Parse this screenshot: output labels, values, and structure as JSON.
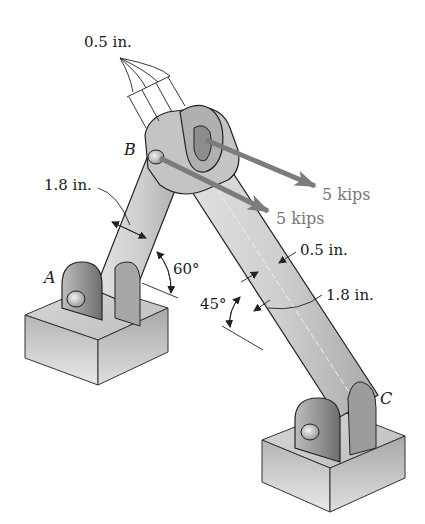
{
  "figure": {
    "type": "engineering-statics-frame",
    "colors": {
      "member_fill": "#c8c8c8",
      "member_dark": "#9a9a9a",
      "member_light": "#e0e0e0",
      "support_fill": "#cfcfcf",
      "support_dark": "#a5a5a5",
      "load_arrow": "#808080",
      "outline": "#222222",
      "text": "#1a1a1a",
      "load_text": "#777777"
    }
  },
  "points": {
    "A": "A",
    "B": "B",
    "C": "C"
  },
  "dimensions": {
    "pin_thickness_top": "0.5 in.",
    "member_ab_width": "1.8 in.",
    "member_bc_thickness": "0.5 in.",
    "member_bc_width": "1.8 in."
  },
  "angles": {
    "member_ab": "60°",
    "member_bc": "45°"
  },
  "loads": [
    {
      "label": "5 kips",
      "position": "upper"
    },
    {
      "label": "5 kips",
      "position": "lower"
    }
  ]
}
